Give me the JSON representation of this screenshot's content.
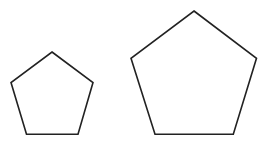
{
  "diagram": {
    "background": "#ffffff",
    "stroke_color": "#222222",
    "stroke_width": 1.6,
    "shapes": [
      {
        "name": "small-pentagon",
        "type": "regular-pentagon",
        "points": "52,52 93,82.5 78,134.3 26.5,134.3 11,82.5"
      },
      {
        "name": "large-pentagon",
        "type": "regular-pentagon",
        "points": "194,11 256.5,58.3 233.3,134.3 155,134.3 131,58.3"
      }
    ]
  }
}
